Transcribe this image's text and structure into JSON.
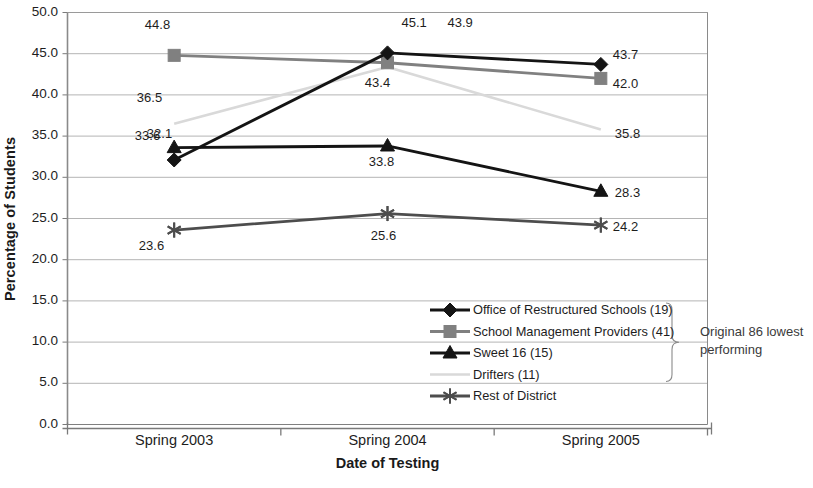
{
  "chart_data": {
    "type": "line",
    "title": "",
    "xlabel": "Date of Testing",
    "ylabel": "Percentage of Students",
    "categories": [
      "Spring 2003",
      "Spring 2004",
      "Spring 2005"
    ],
    "ylim": [
      0.0,
      50.0
    ],
    "ytick_step": 5.0,
    "yticks": [
      "0.0",
      "5.0",
      "10.0",
      "15.0",
      "20.0",
      "25.0",
      "30.0",
      "35.0",
      "40.0",
      "45.0",
      "50.0"
    ],
    "grid": true,
    "legend_position": "inside-bottom-right",
    "series": [
      {
        "name": "Office of Restructured Schools (19)",
        "values": [
          32.1,
          45.1,
          43.7
        ],
        "color": "#141414",
        "marker": "diamond",
        "labels": [
          "32.1",
          "45.1",
          "43.7"
        ]
      },
      {
        "name": "School Management Providers (41)",
        "values": [
          44.8,
          43.9,
          42.0
        ],
        "color": "#808080",
        "marker": "square",
        "labels": [
          "44.8",
          "43.9",
          "42.0"
        ]
      },
      {
        "name": "Sweet 16 (15)",
        "values": [
          33.6,
          33.8,
          28.3
        ],
        "color": "#141414",
        "marker": "triangle",
        "labels": [
          "33.6",
          "33.8",
          "28.3"
        ]
      },
      {
        "name": "Drifters (11)",
        "values": [
          36.5,
          43.4,
          35.8
        ],
        "color": "#d9d9d9",
        "marker": "none",
        "labels": [
          "36.5",
          "43.4",
          "35.8"
        ]
      },
      {
        "name": "Rest of District",
        "values": [
          23.6,
          25.6,
          24.2
        ],
        "color": "#4d4d4d",
        "marker": "asterisk",
        "labels": [
          "23.6",
          "25.6",
          "24.2"
        ]
      }
    ],
    "annotations": [
      {
        "text_line1": "Original 86 lowest",
        "text_line2": "performing",
        "brace_covers": [
          "Office of Restructured Schools (19)",
          "School Management Providers (41)",
          "Sweet 16 (15)",
          "Drifters (11)"
        ]
      }
    ]
  },
  "axis": {
    "y_title": "Percentage of Students",
    "x_title": "Date of Testing"
  },
  "legend": {
    "items": [
      {
        "label": "Office of Restructured Schools (19)"
      },
      {
        "label": "School Management Providers (41)"
      },
      {
        "label": "Sweet 16 (15)"
      },
      {
        "label": "Drifters (11)"
      },
      {
        "label": "Rest of District"
      }
    ]
  },
  "annotation": {
    "line1": "Original 86 lowest",
    "line2": "performing"
  }
}
